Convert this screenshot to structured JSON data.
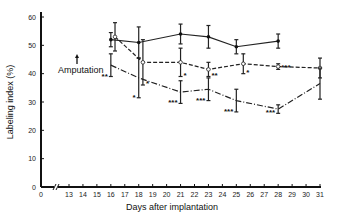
{
  "chart_data": {
    "type": "line",
    "title": "",
    "xlabel": "Days after implantation",
    "ylabel": "Labeling index (%)",
    "ylim": [
      0,
      60
    ],
    "yticks": [
      0,
      10,
      20,
      30,
      40,
      50,
      60
    ],
    "xticks": [
      0,
      13,
      14,
      15,
      16,
      17,
      18,
      19,
      20,
      21,
      22,
      23,
      24,
      25,
      26,
      27,
      28,
      29,
      30,
      31
    ],
    "axis_break": true,
    "grid": false,
    "legend": null,
    "annotation": {
      "text": "Amputation",
      "arrow": "up",
      "x_day": 15
    },
    "series": [
      {
        "name": "control",
        "style": "solid",
        "marker": "filled-circle",
        "points": [
          {
            "x": 16,
            "y": 52,
            "err": 2.5
          },
          {
            "x": 18,
            "y": 51,
            "err": 5.5
          },
          {
            "x": 21,
            "y": 54,
            "err": 3.5
          },
          {
            "x": 23,
            "y": 53,
            "err": 4
          },
          {
            "x": 25,
            "y": 49.5,
            "err": 2.5
          },
          {
            "x": 28,
            "y": 51.5,
            "err": 2.5
          }
        ]
      },
      {
        "name": "treatment-dashed",
        "style": "dashed",
        "marker": "open-circle",
        "points": [
          {
            "x": 16.3,
            "y": 53,
            "err": 5,
            "sig": ""
          },
          {
            "x": 18.3,
            "y": 44,
            "err": 8,
            "sig": "*"
          },
          {
            "x": 21,
            "y": 44,
            "err": 5,
            "sig": "*"
          },
          {
            "x": 23,
            "y": 41.5,
            "err": 2.5,
            "sig": "**"
          },
          {
            "x": 25.5,
            "y": 43.5,
            "err": 3.5,
            "sig": "*"
          },
          {
            "x": 28,
            "y": 42.5,
            "err": 1,
            "sig": "***"
          },
          {
            "x": 31,
            "y": 42,
            "err": 3.5,
            "sig": ""
          }
        ]
      },
      {
        "name": "treatment-dashdot",
        "style": "dash-dot",
        "marker": "none",
        "points": [
          {
            "x": 16,
            "y": 43,
            "err": 4,
            "sig": "**"
          },
          {
            "x": 18,
            "y": 38.5,
            "err": 7,
            "sig": "*"
          },
          {
            "x": 21,
            "y": 33.5,
            "err": 4,
            "sig": "***"
          },
          {
            "x": 23,
            "y": 34.5,
            "err": 4,
            "sig": "***"
          },
          {
            "x": 25,
            "y": 30.5,
            "err": 4,
            "sig": "***"
          },
          {
            "x": 28,
            "y": 27.5,
            "err": 1.5,
            "sig": "***"
          },
          {
            "x": 31,
            "y": 36.5,
            "err": 5.5,
            "sig": ""
          }
        ]
      }
    ]
  }
}
